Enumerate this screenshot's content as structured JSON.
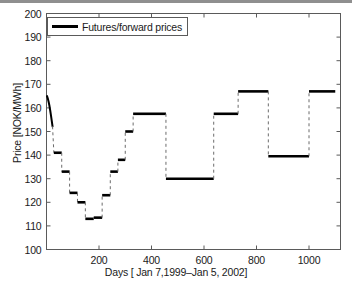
{
  "chart_data": {
    "type": "line",
    "title": "",
    "xlabel": "Days [ Jan 7,1999–Jan 5, 2002]",
    "ylabel": "Price [NOK/MWh]",
    "xlim": [
      0,
      1120
    ],
    "ylim": [
      100,
      200
    ],
    "xticks": [
      200,
      400,
      600,
      800,
      1000
    ],
    "yticks": [
      100,
      110,
      120,
      130,
      140,
      150,
      160,
      170,
      180,
      190,
      200
    ],
    "grid": false,
    "legend": {
      "position": "upper-left",
      "entries": [
        "Futures/forward prices"
      ]
    },
    "series": [
      {
        "name": "Futures/forward prices",
        "style": "step-with-dashed-connectors",
        "color": "#000000",
        "lead_curve": [
          [
            2,
            165.0
          ],
          [
            5,
            164.0
          ],
          [
            8,
            162.6
          ],
          [
            11,
            161.0
          ],
          [
            14,
            159.0
          ],
          [
            17,
            156.8
          ],
          [
            20,
            154.5
          ],
          [
            23,
            152.2
          ]
        ],
        "steps": [
          {
            "x0": 28,
            "x1": 58,
            "y": 141.0
          },
          {
            "x0": 58,
            "x1": 88,
            "y": 133.0
          },
          {
            "x0": 88,
            "x1": 118,
            "y": 124.0
          },
          {
            "x0": 118,
            "x1": 148,
            "y": 120.0
          },
          {
            "x0": 148,
            "x1": 180,
            "y": 113.0
          },
          {
            "x0": 180,
            "x1": 212,
            "y": 113.5
          },
          {
            "x0": 212,
            "x1": 243,
            "y": 123.0
          },
          {
            "x0": 243,
            "x1": 272,
            "y": 133.0
          },
          {
            "x0": 272,
            "x1": 300,
            "y": 138.0
          },
          {
            "x0": 300,
            "x1": 330,
            "y": 150.0
          },
          {
            "x0": 330,
            "x1": 360,
            "y": 157.5
          },
          {
            "x0": 360,
            "x1": 455,
            "y": 157.5
          },
          {
            "x0": 455,
            "x1": 637,
            "y": 130.0
          },
          {
            "x0": 637,
            "x1": 730,
            "y": 157.5
          },
          {
            "x0": 730,
            "x1": 845,
            "y": 167.0
          },
          {
            "x0": 845,
            "x1": 1000,
            "y": 139.5
          },
          {
            "x0": 1000,
            "x1": 1100,
            "y": 167.0
          }
        ]
      }
    ]
  }
}
